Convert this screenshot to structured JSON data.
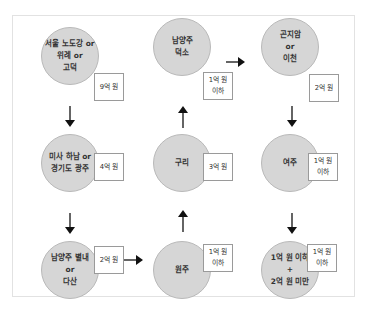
{
  "diagram": {
    "nodes": [
      {
        "id": "n1",
        "label": "서울 노도강 or\n위례 or\n고덕",
        "price": "9억 원"
      },
      {
        "id": "n2",
        "label": "미사 하남 or\n경기도 광주",
        "price": "4억 원"
      },
      {
        "id": "n3",
        "label": "남양주 별내\nor\n다산",
        "price": "2억 원"
      },
      {
        "id": "n4",
        "label": "원주",
        "price": "1억 원\n이하"
      },
      {
        "id": "n5",
        "label": "구리",
        "price": "3억 원"
      },
      {
        "id": "n6",
        "label": "남양주\n덕소",
        "price": "1억 원\n이하"
      },
      {
        "id": "n7",
        "label": "곤지암\nor\n이천",
        "price": "2억 원"
      },
      {
        "id": "n8",
        "label": "여주",
        "price": "1억 원\n이하"
      },
      {
        "id": "n9",
        "label": "1억 원 이하\n+\n2억 원 미만",
        "price": "1억 원\n이하"
      }
    ],
    "edges": [
      {
        "from": "n1",
        "to": "n2",
        "direction": "down"
      },
      {
        "from": "n2",
        "to": "n3",
        "direction": "down"
      },
      {
        "from": "n3",
        "to": "n4",
        "direction": "right"
      },
      {
        "from": "n4",
        "to": "n5",
        "direction": "up"
      },
      {
        "from": "n5",
        "to": "n6",
        "direction": "up"
      },
      {
        "from": "n6",
        "to": "n7",
        "direction": "right"
      },
      {
        "from": "n7",
        "to": "n8",
        "direction": "down"
      },
      {
        "from": "n8",
        "to": "n9",
        "direction": "down"
      }
    ],
    "colors": {
      "circle_fill": "#d6d6d6",
      "circle_border": "#b9b9b9",
      "box_border": "#9a9a9a",
      "arrow": "#111111",
      "frame": "#e2e2e2"
    }
  }
}
